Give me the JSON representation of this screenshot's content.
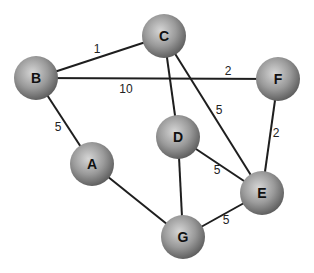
{
  "diagram": {
    "type": "weighted-graph",
    "node_radius": 22,
    "node_color": "#9a9a9a",
    "node_highlight": "#d6d6d6",
    "node_shadow": "#5a5a5a",
    "edge_color": "#1e1e1e",
    "nodes": [
      {
        "id": "B",
        "label": "B",
        "x": 36,
        "y": 78
      },
      {
        "id": "C",
        "label": "C",
        "x": 164,
        "y": 36
      },
      {
        "id": "F",
        "label": "F",
        "x": 278,
        "y": 79
      },
      {
        "id": "D",
        "label": "D",
        "x": 178,
        "y": 137
      },
      {
        "id": "A",
        "label": "A",
        "x": 92,
        "y": 164
      },
      {
        "id": "E",
        "label": "E",
        "x": 262,
        "y": 193
      },
      {
        "id": "G",
        "label": "G",
        "x": 183,
        "y": 237
      }
    ],
    "edges": [
      {
        "from": "B",
        "to": "C",
        "label": "1",
        "lx": 97,
        "ly": 53
      },
      {
        "from": "B",
        "to": "F",
        "label": "10",
        "lx": 126,
        "ly": 93
      },
      {
        "from": "B",
        "to": "F",
        "label": "2",
        "lx": 228,
        "ly": 75,
        "second_label": true
      },
      {
        "from": "B",
        "to": "A",
        "label": "5",
        "lx": 58,
        "ly": 131
      },
      {
        "from": "C",
        "to": "D",
        "label": ""
      },
      {
        "from": "C",
        "to": "E",
        "label": "5",
        "lx": 219,
        "ly": 114
      },
      {
        "from": "F",
        "to": "E",
        "label": "2",
        "lx": 276,
        "ly": 137
      },
      {
        "from": "D",
        "to": "E",
        "label": "5",
        "lx": 217,
        "ly": 174
      },
      {
        "from": "D",
        "to": "G",
        "label": ""
      },
      {
        "from": "A",
        "to": "G",
        "label": ""
      },
      {
        "from": "G",
        "to": "E",
        "label": "5",
        "lx": 226,
        "ly": 224
      }
    ]
  }
}
